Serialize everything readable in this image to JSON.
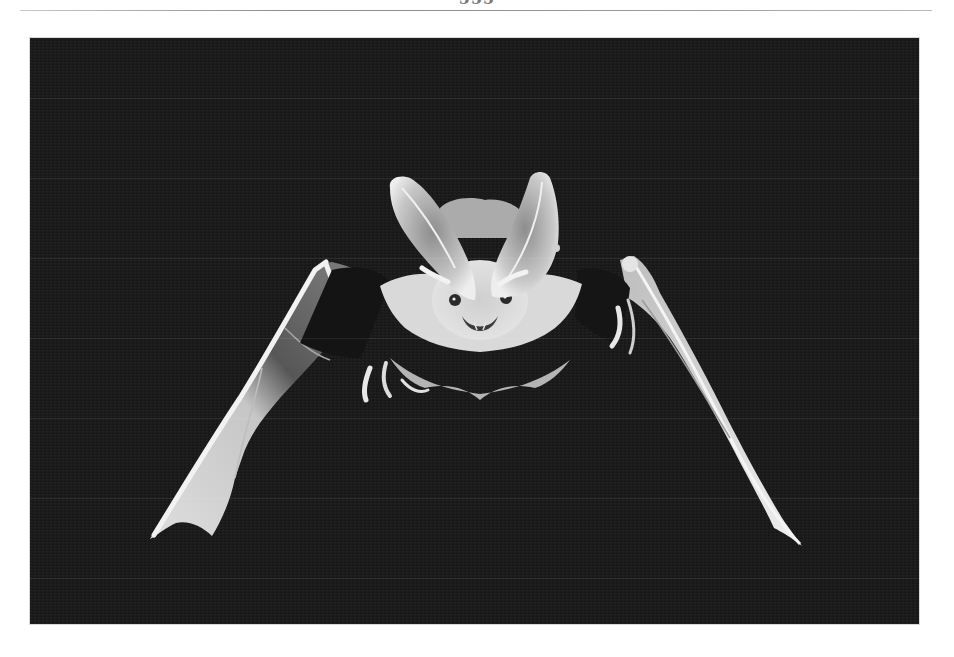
{
  "page": {
    "page_number": "555",
    "header_rule": true
  },
  "figure": {
    "type": "photograph",
    "tone": "black-and-white",
    "background_color": "#1a1a1a",
    "subject_color": "#e6e6e6"
  }
}
